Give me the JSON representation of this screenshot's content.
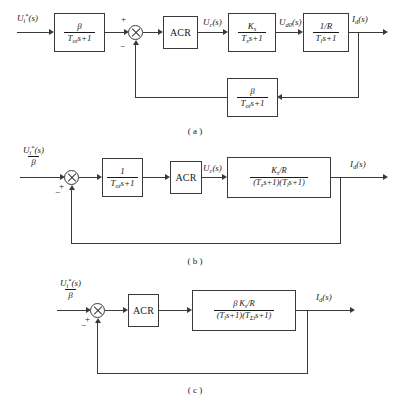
{
  "figure": {
    "captions": {
      "a": "( a )",
      "b": "( b )",
      "c": "( c )"
    }
  },
  "symbols": {
    "beta": "β",
    "sigma": "Σ",
    "plus": "+",
    "minus": "−"
  },
  "diagram_a": {
    "input_signal": "U",
    "input_sub": "i",
    "input_star": "*",
    "input_arg": "(s)",
    "filter_block": {
      "num": "β",
      "den_T": "T",
      "den_sub": "oi",
      "den_tail": "s+1"
    },
    "sum_signs": {
      "positive": "+",
      "negative": "−"
    },
    "controller_label": "ACR",
    "uc_signal": "U",
    "uc_sub": "c",
    "uc_arg": "(s)",
    "converter_block": {
      "num_K": "K",
      "num_sub": "s",
      "den_T": "T",
      "den_sub": "s",
      "den_tail": "s+1"
    },
    "ud0_signal": "U",
    "ud0_sub": "d0",
    "ud0_arg": "(s)",
    "plant_block": {
      "num": "1/R",
      "den_T": "T",
      "den_sub": "l",
      "den_tail": "s+1"
    },
    "output_signal": "I",
    "output_sub": "d",
    "output_arg": "(s)",
    "feedback_block": {
      "num": "β",
      "den_T": "T",
      "den_sub": "oi",
      "den_tail": "s+1"
    }
  },
  "diagram_b": {
    "input_num_signal": "U",
    "input_num_sub": "i",
    "input_num_star": "*",
    "input_num_arg": "(s)",
    "input_den": "β",
    "sum_signs": {
      "positive": "+",
      "negative": "−"
    },
    "filter_block": {
      "num": "1",
      "den_T": "T",
      "den_sub": "oi",
      "den_tail": "s+1"
    },
    "controller_label": "ACR",
    "uc_signal": "U",
    "uc_sub": "c",
    "uc_arg": "(s)",
    "plant_block": {
      "num_K": "K",
      "num_sub": "s",
      "num_tail": "/R",
      "den": "(T s+1)(T s+1)",
      "den_T1_sub": "s",
      "den_T2_sub": "l"
    },
    "output_signal": "I",
    "output_sub": "d",
    "output_arg": "(s)"
  },
  "diagram_c": {
    "input_num_signal": "U",
    "input_num_sub": "i",
    "input_num_star": "*",
    "input_num_arg": "(s)",
    "input_den": "β",
    "sum_signs": {
      "positive": "+",
      "negative": "−"
    },
    "controller_label": "ACR",
    "plant_block": {
      "num_beta": "β",
      "num_K": "K",
      "num_sub": "s",
      "num_tail": "/R",
      "den_T1_sub": "l",
      "den_T2_sub": "Σi"
    },
    "output_signal": "I",
    "output_sub": "d",
    "output_arg": "(s)"
  }
}
